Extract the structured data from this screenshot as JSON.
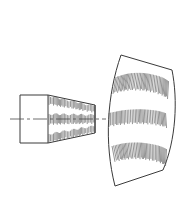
{
  "canvas": {
    "width": 189,
    "height": 219,
    "background_color": "#ffffff",
    "title": "Technical line drawing — conical frustum side view and curved sector development"
  },
  "style": {
    "outline_color": "#3a3a3a",
    "outline_width": 1.0,
    "hatch_color": "#5a5a5a",
    "hatch_width": 0.65,
    "centerline_color": "#4a4a4a",
    "centerline_width": 0.8,
    "fill_color": "#ffffff"
  },
  "figures": [
    {
      "id": "frustum-view",
      "name": "conical-frustum-side-view",
      "label": "",
      "description": "Left view: rectangular cylinder section joined to a tapering frustum, vertically hatched, bisected by a dash-dot centerline.",
      "outline_points": "20,95 48,95 95,105 95,133 48,143 20,143",
      "parts": {
        "cylinder": {
          "x": 20,
          "y": 95,
          "width": 28,
          "height": 48
        },
        "taper": {
          "left_top": [
            48,
            95
          ],
          "right_top": [
            95,
            105
          ],
          "right_bottom": [
            95,
            133
          ],
          "left_bottom": [
            48,
            143
          ]
        }
      },
      "internal_lines": [
        "48,95 48,143",
        "95,105 95,133"
      ],
      "hatch_bands": [
        {
          "name": "upper-hatch-band",
          "top_path": "49,96 94,106",
          "bottom_path": "49,104 94,112",
          "line_count": 34,
          "orientation": "vertical"
        },
        {
          "name": "middle-hatch-band",
          "top_path": "49,114 94,115",
          "bottom_path": "49,124 94,123",
          "line_count": 34,
          "orientation": "vertical"
        },
        {
          "name": "lower-hatch-band",
          "top_path": "49,134 94,126",
          "bottom_path": "49,142 94,132",
          "line_count": 34,
          "orientation": "vertical"
        }
      ],
      "centerline": {
        "name": "axis-centerline",
        "x1": 10,
        "y1": 119,
        "x2": 106,
        "y2": 119,
        "dash_pattern": "14 3 3 3"
      }
    },
    {
      "id": "sector-view",
      "name": "curved-sector-development",
      "label": "",
      "description": "Right view: a curved annular sector (bent plate development) with three vertically hatched bands following the curvature.",
      "outline_path": "M 121,55 L 172,70 C 178,100 176,140 163,170 L 115,186 C 104,143 107,95 121,55 Z",
      "corners": {
        "top_left": [
          121,
          55
        ],
        "top_right": [
          172,
          70
        ],
        "bottom_right": [
          163,
          170
        ],
        "bottom_left": [
          115,
          186
        ]
      },
      "hatch_bands": [
        {
          "name": "upper-hatch-band",
          "top_path": "M 116,77 C 133,71 154,73 169,82",
          "bottom_path": "M 113,93 C 131,87 153,89 168,98",
          "line_count": 40,
          "orientation": "radial-vertical"
        },
        {
          "name": "middle-hatch-band",
          "top_path": "M 109,113 C 128,109 150,109 166,114",
          "bottom_path": "M 109,126 C 128,122 151,122 167,127",
          "line_count": 40,
          "orientation": "radial-vertical"
        },
        {
          "name": "lower-hatch-band",
          "top_path": "M 112,146 C 130,141 152,143 167,150",
          "bottom_path": "M 115,161 C 132,156 153,158 166,165",
          "line_count": 40,
          "orientation": "radial-vertical"
        }
      ]
    }
  ]
}
